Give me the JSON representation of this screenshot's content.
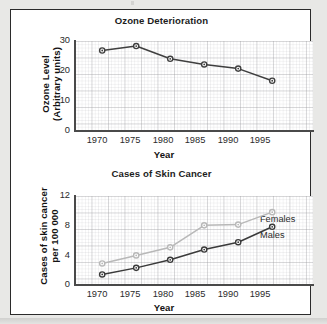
{
  "figure": {
    "background_color": "#e8e8e6",
    "panel_color": "#ffffff",
    "border_color": "#2b2b2b"
  },
  "charts": [
    {
      "id": "ozone",
      "title": "Ozone Deterioration",
      "xlabel": "Year",
      "ylabel": "Ozone Level\n(Arbitrary units)",
      "yticks": [
        "0",
        "10",
        "20",
        "30"
      ],
      "xticks": [
        "1970",
        "1975",
        "1980",
        "1985",
        "1990",
        "1995"
      ]
    },
    {
      "id": "skin-cancer",
      "title": "Cases of Skin Cancer",
      "xlabel": "Year",
      "ylabel": "Cases of skin cancer\nper 100 000",
      "yticks": [
        "0",
        "4",
        "8",
        "12"
      ],
      "xticks": [
        "1970",
        "1975",
        "1980",
        "1985",
        "1990",
        "1995"
      ],
      "series_labels": {
        "females": "Females",
        "males": "Males"
      }
    }
  ],
  "chart_data": [
    {
      "type": "line",
      "title": "Ozone Deterioration",
      "xlabel": "Year",
      "ylabel": "Ozone Level (Arbitrary units)",
      "x": [
        1970,
        1975,
        1980,
        1985,
        1990,
        1995
      ],
      "categories": [
        "1970",
        "1975",
        "1980",
        "1985",
        "1990",
        "1995"
      ],
      "series": [
        {
          "name": "Ozone Level",
          "values": [
            26.8,
            28.3,
            24.0,
            22.1,
            20.7,
            16.6
          ],
          "color": "#3f3f3f",
          "marker": "circle"
        }
      ],
      "xlim": [
        1966,
        2001
      ],
      "ylim": [
        0,
        30
      ],
      "yticks": [
        0,
        10,
        20,
        30
      ],
      "grid": true,
      "legend": "none"
    },
    {
      "type": "line",
      "title": "Cases of Skin Cancer",
      "xlabel": "Year",
      "ylabel": "Cases of skin cancer per 100 000",
      "x": [
        1970,
        1975,
        1980,
        1985,
        1990,
        1995
      ],
      "categories": [
        "1970",
        "1975",
        "1980",
        "1985",
        "1990",
        "1995"
      ],
      "series": [
        {
          "name": "Females",
          "values": [
            2.8,
            3.9,
            5.0,
            8.0,
            8.1,
            9.8
          ],
          "color": "#b8b8b8",
          "marker": "circle"
        },
        {
          "name": "Males",
          "values": [
            1.3,
            2.2,
            3.3,
            4.7,
            5.7,
            7.8
          ],
          "color": "#3a3a3a",
          "marker": "circle"
        }
      ],
      "xlim": [
        1966,
        2001
      ],
      "ylim": [
        0,
        12
      ],
      "yticks": [
        0,
        4,
        8,
        12
      ],
      "grid": true,
      "legend": "inline-right"
    }
  ]
}
